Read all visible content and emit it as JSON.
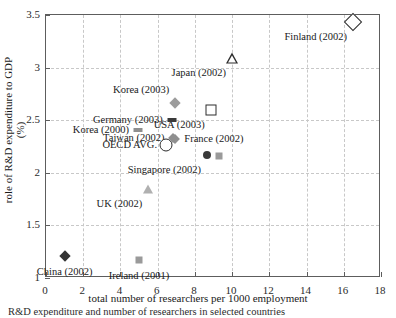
{
  "chart_data": {
    "type": "scatter",
    "title": "",
    "xlabel": "total number of researchers per 1000 employment",
    "ylabel": "role of R&D expenditure to GDP (%)",
    "xlim": [
      0,
      18
    ],
    "ylim": [
      1,
      3.5
    ],
    "xticks": [
      "0",
      "2",
      "4",
      "6",
      "8",
      "10",
      "12",
      "14",
      "16",
      "18"
    ],
    "yticks": [
      "1",
      "1.5",
      "2",
      "2.5",
      "3",
      "3.5"
    ],
    "grid": true,
    "legend": "none",
    "points": [
      {
        "label": "Finland (2002)",
        "x": 16.5,
        "y": 3.43,
        "marker": "diamond-open",
        "label_pos": "below-left"
      },
      {
        "label": "Japan (2002)",
        "x": 10.0,
        "y": 3.09,
        "marker": "triangle-open",
        "label_pos": "below-left"
      },
      {
        "label": "Korea (2003)",
        "x": 6.95,
        "y": 2.66,
        "marker": "diamond-gray",
        "label_pos": "above-left"
      },
      {
        "label": "USA (2003)",
        "x": 8.85,
        "y": 2.6,
        "marker": "square-open",
        "label_pos": "below-left"
      },
      {
        "label": "Germany (2003)",
        "x": 6.75,
        "y": 2.5,
        "marker": "dash-dark",
        "label_pos": "left"
      },
      {
        "label": "Korea (2000)",
        "x": 4.95,
        "y": 2.41,
        "marker": "dash-gray",
        "label_pos": "left"
      },
      {
        "label": "Taiwan (2002)",
        "x": 6.85,
        "y": 2.33,
        "marker": "diamond-gray-sm",
        "label_pos": "left"
      },
      {
        "label": "France (2002)",
        "x": 6.95,
        "y": 2.32,
        "marker": "diamond-gray-sm",
        "label_pos": "right"
      },
      {
        "label": "OECD AVG.",
        "x": 6.45,
        "y": 2.26,
        "marker": "circle-open",
        "label_pos": "left"
      },
      {
        "label": "Singapore (2002)",
        "x": 8.65,
        "y": 2.17,
        "marker": "circle-dark",
        "label_pos": "below-left"
      },
      {
        "label": "",
        "x": 9.3,
        "y": 2.16,
        "marker": "square-gray",
        "label_pos": "none"
      },
      {
        "label": "UK (2002)",
        "x": 5.5,
        "y": 1.85,
        "marker": "triangle-gray",
        "label_pos": "below-left"
      },
      {
        "label": "Ireland (2001)",
        "x": 5.0,
        "y": 1.17,
        "marker": "square-gray",
        "label_pos": "below"
      },
      {
        "label": "China (2002)",
        "x": 1.0,
        "y": 1.21,
        "marker": "diamond-dark",
        "label_pos": "below"
      }
    ]
  },
  "axes": {
    "x_label": "total number of researchers per 1000 employment",
    "y_label": "role of R&D expenditure to GDP (%)",
    "x_tick_labels": [
      "0",
      "2",
      "4",
      "6",
      "8",
      "10",
      "12",
      "14",
      "16",
      "18"
    ],
    "y_tick_labels": [
      "1",
      "1.5",
      "2",
      "2.5",
      "3",
      "3.5"
    ]
  },
  "point_labels": {
    "finland": "Finland (2002)",
    "japan": "Japan (2002)",
    "korea_2003": "Korea (2003)",
    "usa": "USA (2003)",
    "germany": "Germany (2003)",
    "korea_2000": "Korea (2000)",
    "taiwan": "Taiwan (2002)",
    "france": "France (2002)",
    "oecd": "OECD AVG.",
    "singapore": "Singapore (2002)",
    "uk": "UK (2002)",
    "ireland": "Ireland (2001)",
    "china": "China (2002)"
  },
  "caption": "R&D expenditure and number of researchers in selected countries"
}
